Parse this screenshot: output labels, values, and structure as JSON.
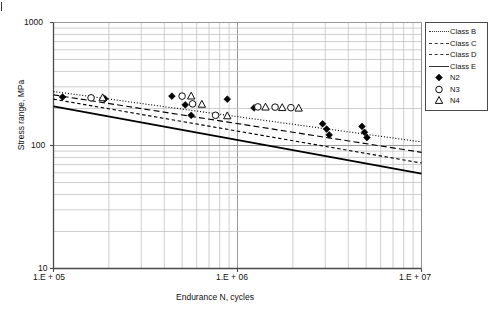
{
  "chart_data": {
    "type": "scatter",
    "title": "",
    "xlabel": "Endurance N, cycles",
    "ylabel": "Stress range, MPa",
    "xscale": "log",
    "yscale": "log",
    "xlim": [
      100000,
      10000000
    ],
    "ylim": [
      10,
      1000
    ],
    "xticks": [
      100000,
      1000000,
      10000000
    ],
    "xticklabels": [
      "1.E + 05",
      "1.E + 06",
      "1.E + 07"
    ],
    "yticks": [
      10,
      100,
      1000
    ],
    "yticklabels": [
      "10",
      "100",
      "1000"
    ],
    "grid": "minor-log-both",
    "legend_position": "upper-right-outside",
    "series": [
      {
        "name": "Class B",
        "kind": "line",
        "style": "dotted",
        "points": [
          [
            100000,
            275
          ],
          [
            10000000,
            107
          ]
        ]
      },
      {
        "name": "Class C",
        "kind": "line",
        "style": "dashed",
        "points": [
          [
            100000,
            258
          ],
          [
            10000000,
            88
          ]
        ]
      },
      {
        "name": "Class D",
        "kind": "line",
        "style": "short-dashed",
        "points": [
          [
            100000,
            238
          ],
          [
            10000000,
            72
          ]
        ]
      },
      {
        "name": "Class E",
        "kind": "line",
        "style": "solid",
        "points": [
          [
            100000,
            208
          ],
          [
            10000000,
            59
          ]
        ]
      },
      {
        "name": "N2",
        "kind": "marker",
        "marker": "filled-diamond",
        "points": [
          [
            112000,
            248
          ],
          [
            190000,
            240
          ],
          [
            440000,
            252
          ],
          [
            520000,
            214
          ],
          [
            560000,
            176
          ],
          [
            880000,
            238
          ],
          [
            1230000,
            202
          ],
          [
            2900000,
            150
          ],
          [
            3050000,
            136
          ],
          [
            3150000,
            122
          ],
          [
            4750000,
            143
          ],
          [
            4900000,
            128
          ],
          [
            5050000,
            116
          ]
        ]
      },
      {
        "name": "N3",
        "kind": "marker",
        "marker": "open-circle",
        "points": [
          [
            160000,
            244
          ],
          [
            500000,
            252
          ],
          [
            570000,
            218
          ],
          [
            760000,
            176
          ],
          [
            1290000,
            206
          ],
          [
            1600000,
            205
          ],
          [
            1950000,
            203
          ]
        ]
      },
      {
        "name": "N4",
        "kind": "marker",
        "marker": "open-triangle",
        "points": [
          [
            185000,
            244
          ],
          [
            560000,
            252
          ],
          [
            640000,
            216
          ],
          [
            880000,
            174
          ],
          [
            1420000,
            205
          ],
          [
            1750000,
            203
          ],
          [
            2150000,
            201
          ]
        ]
      }
    ]
  },
  "axes": {
    "x": {
      "label": "Endurance N, cycles",
      "ticklabels": [
        "1.E + 05",
        "1.E + 06",
        "1.E + 07"
      ]
    },
    "y": {
      "label": "Stress range, MPa",
      "ticklabels": [
        "1000",
        "100",
        "10"
      ]
    }
  },
  "legend": {
    "items": [
      {
        "label": "Class B",
        "sample": "dotted-line"
      },
      {
        "label": "Class C",
        "sample": "dashed-line"
      },
      {
        "label": "Class D",
        "sample": "short-dashed-line"
      },
      {
        "label": "Class E",
        "sample": "solid-line"
      },
      {
        "label": "N2",
        "sample": "filled-diamond"
      },
      {
        "label": "N3",
        "sample": "open-circle"
      },
      {
        "label": "N4",
        "sample": "open-triangle"
      }
    ]
  },
  "colors": {
    "axis": "#4a4a4a",
    "grid": "#b9b9b9",
    "ink": "#111111",
    "series": "#000000"
  }
}
